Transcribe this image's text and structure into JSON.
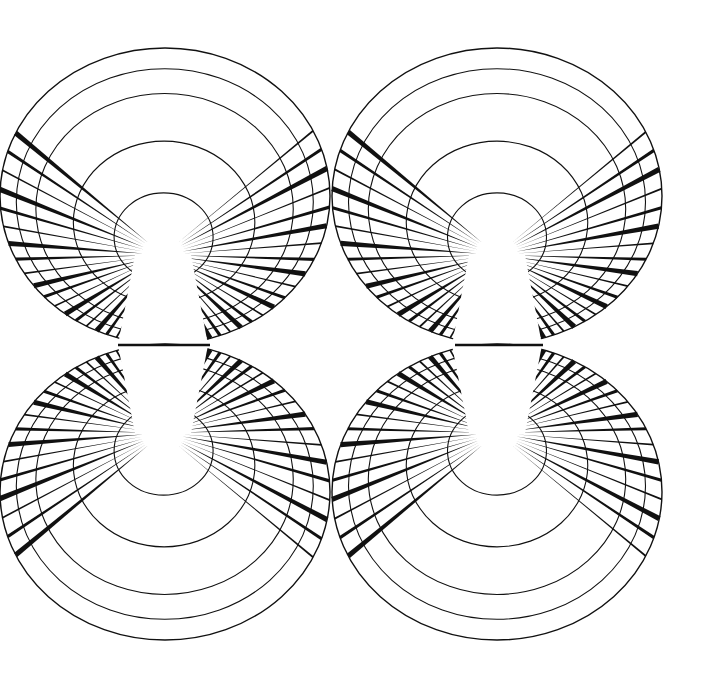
{
  "artwork": {
    "title": "Four radial fan ellipses line art",
    "background": "#ffffff",
    "stroke": "#111111",
    "canvas": {
      "width": 715,
      "height": 686
    },
    "ellipses": [
      {
        "id": "top-left",
        "cx": 165,
        "cy": 196,
        "rx": 165,
        "ry": 148,
        "fx": 163,
        "fy": 255,
        "flip": false
      },
      {
        "id": "top-right",
        "cx": 497,
        "cy": 196,
        "rx": 165,
        "ry": 148,
        "fx": 497,
        "fy": 255,
        "flip": false
      },
      {
        "id": "bottom-left",
        "cx": 165,
        "cy": 492,
        "rx": 165,
        "ry": 148,
        "fx": 163,
        "fy": 433,
        "flip": true
      },
      {
        "id": "bottom-right",
        "cx": 497,
        "cy": 492,
        "rx": 165,
        "ry": 148,
        "fx": 497,
        "fy": 433,
        "flip": true
      }
    ],
    "rings": [
      0.3,
      0.55,
      0.78,
      0.9,
      1.0
    ],
    "spoke_count": 44,
    "connector_y": 345,
    "connectors": [
      {
        "x1": 118,
        "x2": 210
      },
      {
        "x1": 455,
        "x2": 543
      }
    ]
  }
}
